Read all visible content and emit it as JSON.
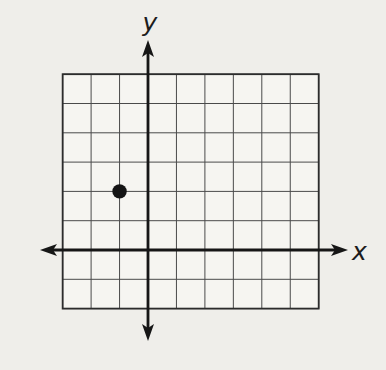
{
  "figure": {
    "background_color": "#efeeea",
    "plot_area_color": "#f6f5f1"
  },
  "chart_data": {
    "type": "scatter",
    "title": "",
    "xlabel": "x",
    "ylabel": "y",
    "xlim": [
      -3,
      6
    ],
    "ylim": [
      -2,
      6
    ],
    "grid": true,
    "grid_columns": 9,
    "grid_rows": 8,
    "points": [
      {
        "x": -1,
        "y": 2
      }
    ],
    "point_radius_px": 7.2,
    "point_color": "#141414",
    "grid_line_color": "#4a4a4a",
    "border_color": "#2c2c2c",
    "axis_color": "#161616",
    "legend": null,
    "annotations": []
  }
}
